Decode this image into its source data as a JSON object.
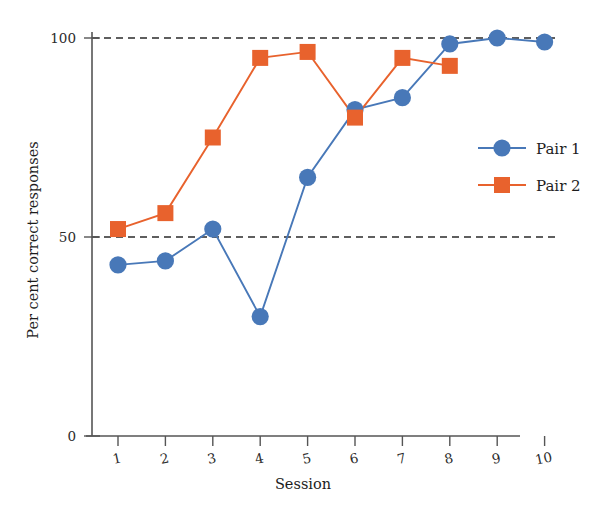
{
  "chart_data": {
    "type": "line",
    "title": "",
    "xlabel": "Session",
    "ylabel": "Per cent correct responses",
    "x": [
      1,
      2,
      3,
      4,
      5,
      6,
      7,
      8,
      9,
      10
    ],
    "xticklabels": [
      "1",
      "2",
      "3",
      "4",
      "5",
      "6",
      "7",
      "8",
      "9",
      "10"
    ],
    "yticklabels": [
      "0",
      "50",
      "100"
    ],
    "yticks": [
      0,
      50,
      100
    ],
    "xlim": [
      0.5,
      10.5
    ],
    "ylim": [
      0,
      100
    ],
    "grid": "horizontal-dashed-at-50-and-100",
    "legend_position": "center-right",
    "series": [
      {
        "name": "Pair 1",
        "marker": "circle",
        "color": "#4878b8",
        "x": [
          1,
          2,
          3,
          4,
          5,
          6,
          7,
          8,
          9,
          10
        ],
        "values": [
          43,
          44,
          52,
          30,
          65,
          82,
          85,
          98.5,
          100,
          99
        ]
      },
      {
        "name": "Pair 2",
        "marker": "square",
        "color": "#e8622d",
        "x": [
          1,
          2,
          3,
          4,
          5,
          6,
          7,
          8
        ],
        "values": [
          52,
          56,
          75,
          95,
          96.5,
          80,
          95,
          93
        ]
      }
    ]
  },
  "legend": {
    "entries": [
      {
        "label": "Pair 1"
      },
      {
        "label": "Pair 2"
      }
    ]
  },
  "colors": {
    "series_1": "#4878b8",
    "series_2": "#e8622d",
    "axis": "#555555",
    "grid": "#2a2a2a",
    "text": "#1d1d1d",
    "background": "#ffffff"
  }
}
